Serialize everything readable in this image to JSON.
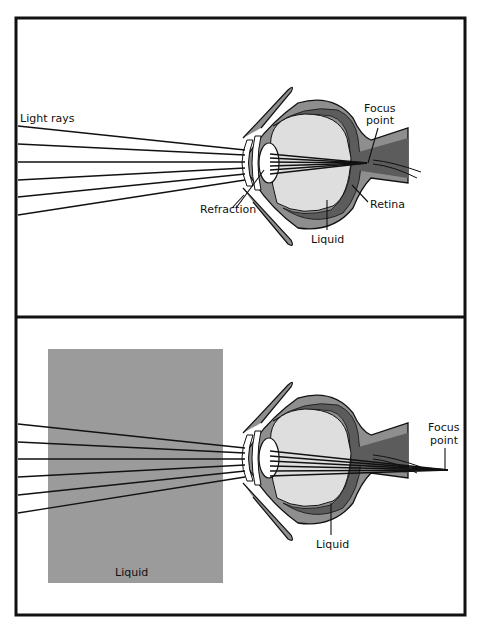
{
  "colors": {
    "frame": "#111111",
    "sclera": "#8e8e8e",
    "retina": "#5c5c5c",
    "interior": "#dedede",
    "nerve": "#6a6a6a",
    "liquid_box": "#9b9b9b",
    "ray": "#111111"
  },
  "top_panel": {
    "labels": {
      "light_rays": "Light rays",
      "focus_point_line1": "Focus",
      "focus_point_line2": "point",
      "refraction": "Refraction",
      "retina": "Retina",
      "liquid": "Liquid"
    }
  },
  "bottom_panel": {
    "labels": {
      "focus_point_line1": "Focus",
      "focus_point_line2": "point",
      "liquid_eye": "Liquid",
      "liquid_box": "Liquid"
    }
  }
}
